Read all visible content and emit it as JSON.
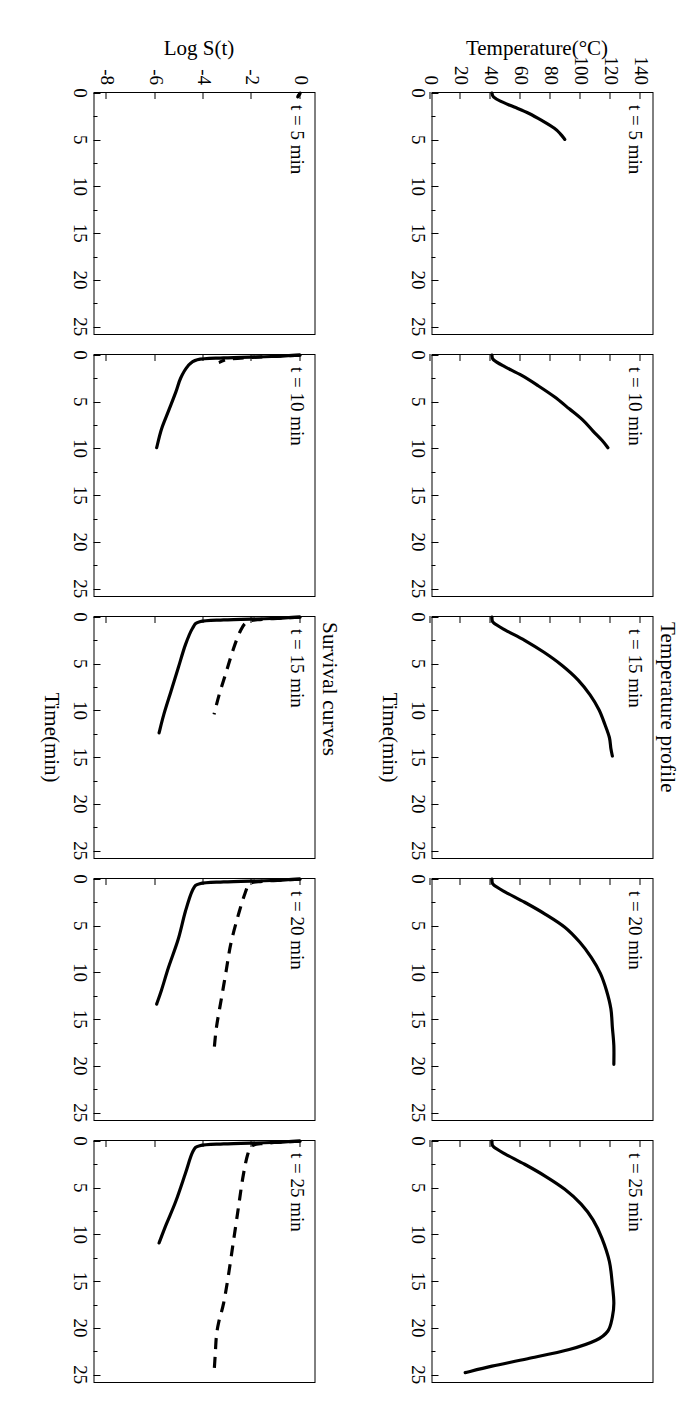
{
  "figure": {
    "rows": [
      {
        "key": "temperature",
        "title": "Temperature profile",
        "ylabel": "Temperature(°C)",
        "xlabel": "Time(min)",
        "yticks": [
          "140",
          "120",
          "100",
          "80",
          "60",
          "40",
          "20",
          "0"
        ],
        "xticks": [
          "0",
          "5",
          "10",
          "15",
          "20",
          "25"
        ]
      },
      {
        "key": "survival",
        "title": "Survival curves",
        "ylabel": "Log S(t)",
        "xlabel": "Time(min)",
        "yticks": [
          "0",
          "-2",
          "-4",
          "-6",
          "-8"
        ],
        "xticks": [
          "0",
          "5",
          "10",
          "15",
          "20",
          "25"
        ]
      }
    ],
    "panel_labels": [
      "t = 5 min",
      "t = 10 min",
      "t = 15 min",
      "t = 20 min",
      "t = 25 min"
    ],
    "colors": {
      "ink": "#000000",
      "paper": "#ffffff"
    }
  },
  "chart_data": [
    {
      "type": "line",
      "title": "Temperature profile",
      "panel": "t = 5 min",
      "xlabel": "Time(min)",
      "ylabel": "Temperature(°C)",
      "xlim": [
        0,
        26
      ],
      "ylim": [
        0,
        148
      ],
      "grid": false,
      "legend": "none",
      "series": [
        {
          "name": "Temperature",
          "style": "solid",
          "x": [
            0,
            0.4,
            0.9,
            1.5,
            2.2,
            3.0,
            3.8,
            4.4,
            5.0
          ],
          "y": [
            40,
            41,
            46,
            55,
            65,
            74,
            82,
            86,
            89
          ]
        }
      ]
    },
    {
      "type": "line",
      "title": "Temperature profile",
      "panel": "t = 10 min",
      "xlabel": "Time(min)",
      "ylabel": "Temperature(°C)",
      "xlim": [
        0,
        26
      ],
      "ylim": [
        0,
        148
      ],
      "grid": false,
      "legend": "none",
      "series": [
        {
          "name": "Temperature",
          "style": "solid",
          "x": [
            0,
            0.5,
            1.2,
            2.2,
            3.3,
            4.5,
            5.8,
            7.0,
            8.2,
            9.2,
            10.0
          ],
          "y": [
            40,
            41,
            48,
            60,
            71,
            82,
            92,
            101,
            108,
            114,
            118
          ]
        }
      ]
    },
    {
      "type": "line",
      "title": "Temperature profile",
      "panel": "t = 15 min",
      "xlabel": "Time(min)",
      "ylabel": "Temperature(°C)",
      "xlim": [
        0,
        26
      ],
      "ylim": [
        0,
        148
      ],
      "grid": false,
      "legend": "none",
      "series": [
        {
          "name": "Temperature",
          "style": "solid",
          "x": [
            0,
            0.6,
            1.4,
            2.5,
            3.8,
            5.2,
            6.8,
            8.4,
            10.0,
            11.6,
            13.0,
            14.2,
            15.0
          ],
          "y": [
            40,
            41,
            49,
            62,
            75,
            87,
            98,
            106,
            112,
            116,
            119,
            120,
            121
          ]
        }
      ]
    },
    {
      "type": "line",
      "title": "Temperature profile",
      "panel": "t = 20 min",
      "xlabel": "Time(min)",
      "ylabel": "Temperature(°C)",
      "xlim": [
        0,
        26
      ],
      "ylim": [
        0,
        148
      ],
      "grid": false,
      "legend": "none",
      "series": [
        {
          "name": "Temperature",
          "style": "solid",
          "x": [
            0,
            0.6,
            1.4,
            2.5,
            3.8,
            5.2,
            6.8,
            8.5,
            10.2,
            12.0,
            14.0,
            16.0,
            18.0,
            20.0
          ],
          "y": [
            40,
            41,
            49,
            62,
            76,
            89,
            99,
            107,
            113,
            117,
            120,
            121,
            122,
            122
          ]
        }
      ]
    },
    {
      "type": "line",
      "title": "Temperature profile",
      "panel": "t = 25 min",
      "xlabel": "Time(min)",
      "ylabel": "Temperature(°C)",
      "xlim": [
        0,
        26
      ],
      "ylim": [
        0,
        148
      ],
      "grid": false,
      "legend": "none",
      "series": [
        {
          "name": "Temperature",
          "style": "solid",
          "x": [
            0,
            0.6,
            1.4,
            2.5,
            3.8,
            5.2,
            6.8,
            8.5,
            10.5,
            13.0,
            15.5,
            17.5,
            19.0,
            20.5,
            21.5,
            22.5,
            23.5,
            24.3,
            25.0
          ],
          "y": [
            40,
            41,
            49,
            62,
            76,
            89,
            100,
            108,
            114,
            119,
            121,
            122,
            121,
            118,
            110,
            92,
            64,
            40,
            22
          ]
        }
      ]
    },
    {
      "type": "line",
      "title": "Survival curves",
      "panel": "t = 5 min",
      "xlabel": "Time(min)",
      "ylabel": "Log S(t)",
      "xlim": [
        0,
        26
      ],
      "ylim": [
        -8.6,
        0.6
      ],
      "grid": false,
      "legend": "none",
      "series": [
        {
          "name": "Curve A (solid)",
          "style": "solid",
          "x": [
            0,
            0.2,
            0.4
          ],
          "y": [
            0,
            -0.05,
            -0.1
          ]
        },
        {
          "name": "Curve B (dashed)",
          "style": "dashed",
          "x": [
            0,
            0.2,
            0.4
          ],
          "y": [
            0,
            -0.05,
            -0.1
          ]
        }
      ]
    },
    {
      "type": "line",
      "title": "Survival curves",
      "panel": "t = 10 min",
      "xlabel": "Time(min)",
      "ylabel": "Log S(t)",
      "xlim": [
        0,
        26
      ],
      "ylim": [
        -8.6,
        0.6
      ],
      "grid": false,
      "legend": "none",
      "series": [
        {
          "name": "Curve A (solid)",
          "style": "solid",
          "x": [
            0,
            0.15,
            0.3,
            0.5,
            1.2,
            2.5,
            4.0,
            6.0,
            8.0,
            10.0
          ],
          "y": [
            0,
            -1.2,
            -3.2,
            -4.3,
            -4.7,
            -5.0,
            -5.2,
            -5.5,
            -5.8,
            -6.0
          ]
        },
        {
          "name": "Curve B (dashed)",
          "style": "dashed",
          "x": [
            0,
            0.1,
            0.25,
            0.45,
            0.8
          ],
          "y": [
            0,
            -0.8,
            -2.0,
            -3.0,
            -3.4
          ]
        }
      ]
    },
    {
      "type": "line",
      "title": "Survival curves",
      "panel": "t = 15 min",
      "xlabel": "Time(min)",
      "ylabel": "Log S(t)",
      "xlim": [
        0,
        26
      ],
      "ylim": [
        -8.6,
        0.6
      ],
      "grid": false,
      "legend": "none",
      "series": [
        {
          "name": "Curve A (solid)",
          "style": "solid",
          "x": [
            0,
            0.15,
            0.3,
            0.5,
            1.2,
            3.0,
            5.5,
            8.0,
            10.5,
            12.5
          ],
          "y": [
            0,
            -1.2,
            -3.2,
            -4.2,
            -4.5,
            -4.8,
            -5.1,
            -5.4,
            -5.7,
            -5.9
          ]
        },
        {
          "name": "Curve B (dashed)",
          "style": "dashed",
          "x": [
            0,
            0.1,
            0.25,
            0.5,
            1.5,
            3.5,
            6.0,
            8.5,
            10.5
          ],
          "y": [
            0,
            -0.7,
            -1.6,
            -2.2,
            -2.5,
            -2.8,
            -3.1,
            -3.4,
            -3.6
          ]
        }
      ]
    },
    {
      "type": "line",
      "title": "Survival curves",
      "panel": "t = 20 min",
      "xlabel": "Time(min)",
      "ylabel": "Log S(t)",
      "xlim": [
        0,
        26
      ],
      "ylim": [
        -8.6,
        0.6
      ],
      "grid": false,
      "legend": "none",
      "series": [
        {
          "name": "Curve A (solid)",
          "style": "solid",
          "x": [
            0,
            0.15,
            0.3,
            0.5,
            1.2,
            3.5,
            6.5,
            9.5,
            12.0,
            13.5
          ],
          "y": [
            0,
            -1.2,
            -3.2,
            -4.2,
            -4.5,
            -4.8,
            -5.1,
            -5.5,
            -5.8,
            -6.0
          ]
        },
        {
          "name": "Curve B (dashed)",
          "style": "dashed",
          "x": [
            0,
            0.1,
            0.25,
            0.5,
            1.5,
            4.0,
            7.0,
            10.0,
            13.0,
            16.0,
            18.5
          ],
          "y": [
            0,
            -0.7,
            -1.6,
            -2.1,
            -2.3,
            -2.6,
            -2.9,
            -3.1,
            -3.3,
            -3.5,
            -3.6
          ]
        }
      ]
    },
    {
      "type": "line",
      "title": "Survival curves",
      "panel": "t = 25 min",
      "xlabel": "Time(min)",
      "ylabel": "Log S(t)",
      "xlim": [
        0,
        26
      ],
      "ylim": [
        -8.6,
        0.6
      ],
      "grid": false,
      "legend": "none",
      "series": [
        {
          "name": "Curve A (solid)",
          "style": "solid",
          "x": [
            0,
            0.15,
            0.3,
            0.5,
            1.2,
            3.5,
            6.5,
            9.0,
            11.0
          ],
          "y": [
            0,
            -1.2,
            -3.2,
            -4.2,
            -4.5,
            -4.8,
            -5.2,
            -5.6,
            -5.9
          ]
        },
        {
          "name": "Curve B (dashed)",
          "style": "dashed",
          "x": [
            0,
            0.1,
            0.25,
            0.5,
            1.5,
            4.0,
            7.5,
            11.0,
            14.5,
            17.5,
            19.5,
            21.0,
            23.0,
            25.0
          ],
          "y": [
            0,
            -0.7,
            -1.5,
            -2.0,
            -2.2,
            -2.4,
            -2.6,
            -2.8,
            -3.0,
            -3.2,
            -3.4,
            -3.5,
            -3.55,
            -3.6
          ]
        }
      ]
    }
  ]
}
